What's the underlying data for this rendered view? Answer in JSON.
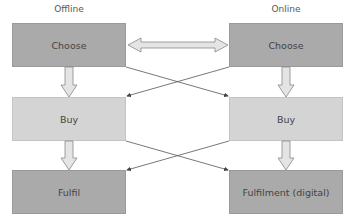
{
  "columns": {
    "offline": {
      "label": "Offline"
    },
    "online": {
      "label": "Online"
    }
  },
  "boxes": {
    "offline_choose": "Choose",
    "offline_buy": "Buy",
    "offline_fulfil": "Fulfil",
    "online_choose": "Choose",
    "online_buy": "Buy",
    "online_fulfil": "Fulfilment (digital)"
  },
  "colors": {
    "dark_box": "#aaaaaa",
    "light_box": "#d4d4d4",
    "arrow_fill": "#e4e4e4",
    "line": "#555555"
  }
}
